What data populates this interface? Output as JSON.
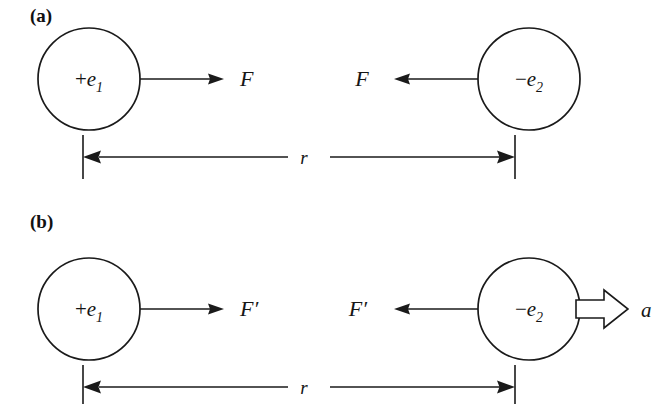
{
  "figure": {
    "background_color": "#ffffff",
    "ink_color": "#1a1a1a",
    "width": 662,
    "height": 404
  },
  "panels": [
    {
      "id": "panel-a",
      "label": "(a)",
      "label_x": 30,
      "label_y": 22,
      "description": "Two charges at rest separated by distance r, equal and opposite forces F",
      "left_charge": {
        "label_sign": "+",
        "label_symbol": "e",
        "label_subscript": "1",
        "full_label": "+e₁",
        "cx": 89,
        "cy": 79,
        "r": 51
      },
      "right_charge": {
        "label_sign": "−",
        "label_symbol": "e",
        "label_subscript": "2",
        "full_label": "−e₂",
        "cx": 529,
        "cy": 79,
        "r": 51
      },
      "left_force": {
        "label": "F",
        "direction": "right",
        "tail_x": 140,
        "tip_x": 224,
        "y": 79,
        "label_x": 240,
        "label_y": 86
      },
      "right_force": {
        "label": "F",
        "direction": "left",
        "tail_x": 478,
        "tip_x": 394,
        "y": 79,
        "label_x": 362,
        "label_y": 86
      },
      "dimension": {
        "label": "r",
        "label_x": 300,
        "label_y": 164,
        "y": 157,
        "left_tick_x": 83,
        "right_tick_x": 515,
        "tick_top": 135,
        "tick_bottom": 179,
        "gap_left": 288,
        "gap_right": 330
      }
    },
    {
      "id": "panel-b",
      "label": "(b)",
      "label_x": 30,
      "label_y": 228,
      "description": "Same charges with modified force F-prime and acceleration a on the negative charge",
      "left_charge": {
        "label_sign": "+",
        "label_symbol": "e",
        "label_subscript": "1",
        "full_label": "+e₁",
        "cx": 89,
        "cy": 309,
        "r": 51
      },
      "right_charge": {
        "label_sign": "−",
        "label_symbol": "e",
        "label_subscript": "2",
        "full_label": "−e₂",
        "cx": 529,
        "cy": 309,
        "r": 51
      },
      "left_force": {
        "label": "F′",
        "direction": "right",
        "tail_x": 140,
        "tip_x": 224,
        "y": 309,
        "label_x": 240,
        "label_y": 316
      },
      "right_force": {
        "label": "F′",
        "direction": "left",
        "tail_x": 478,
        "tip_x": 394,
        "y": 309,
        "label_x": 358,
        "label_y": 316
      },
      "acceleration": {
        "label": "a",
        "direction": "right",
        "style": "hollow-block-arrow",
        "tail_x": 576,
        "tip_x": 628,
        "y": 309,
        "shaft_half_height": 9,
        "head_half_height": 19,
        "head_length": 24,
        "label_x": 641,
        "label_y": 317
      },
      "dimension": {
        "label": "r",
        "label_x": 300,
        "label_y": 394,
        "y": 387,
        "left_tick_x": 83,
        "right_tick_x": 515,
        "tick_top": 365,
        "tick_bottom": 404,
        "gap_left": 288,
        "gap_right": 330
      }
    }
  ]
}
